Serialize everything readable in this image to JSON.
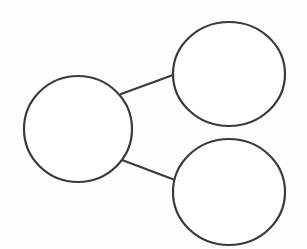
{
  "diagram": {
    "type": "mind-map",
    "background": "#fdfdfb",
    "stroke_color": "#3a3a3a",
    "nodes": [
      {
        "id": "center",
        "label": "",
        "cx": 78,
        "cy": 129,
        "rx": 54,
        "ry": 53
      },
      {
        "id": "top-right",
        "label": "",
        "cx": 229,
        "cy": 74,
        "rx": 56,
        "ry": 52
      },
      {
        "id": "bottom-right",
        "label": "",
        "cx": 229,
        "cy": 192,
        "rx": 56,
        "ry": 53
      }
    ],
    "edges": [
      {
        "from": "center",
        "to": "top-right",
        "x1": 121,
        "y1": 94,
        "x2": 173,
        "y2": 75
      },
      {
        "from": "center",
        "to": "bottom-right",
        "x1": 122,
        "y1": 160,
        "x2": 175,
        "y2": 180
      }
    ]
  }
}
